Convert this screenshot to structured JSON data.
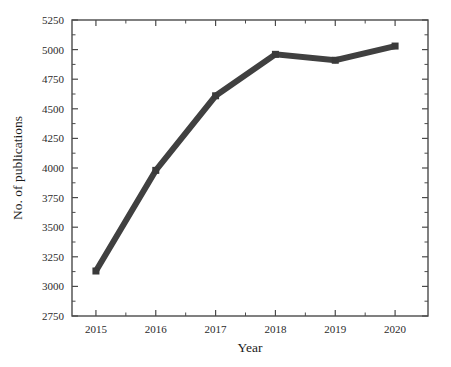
{
  "chart_data": {
    "type": "line",
    "title": "",
    "subtitle": "",
    "xlabel": "Year",
    "ylabel": "No. of publications",
    "categories": [
      "2015",
      "2016",
      "2017",
      "2018",
      "2019",
      "2020"
    ],
    "x": [
      2015,
      2016,
      2017,
      2018,
      2019,
      2020
    ],
    "values": [
      3130,
      3980,
      4610,
      4960,
      4910,
      5030
    ],
    "series": [
      {
        "name": "No. of publications",
        "values": [
          3130,
          3980,
          4610,
          4960,
          4910,
          5030
        ]
      }
    ],
    "ylim": [
      2750,
      5250
    ],
    "xlim": [
      2014.6,
      2020.55
    ],
    "ytick_labels": [
      "2750",
      "3000",
      "3250",
      "3500",
      "3750",
      "4000",
      "4250",
      "4500",
      "4750",
      "5000",
      "5250"
    ],
    "ytick_values": [
      2750,
      3000,
      3250,
      3500,
      3750,
      4000,
      4250,
      4500,
      4750,
      5000,
      5250
    ],
    "xtick_labels": [
      "2015",
      "2016",
      "2017",
      "2018",
      "2019",
      "2020"
    ],
    "xtick_values": [
      2015,
      2016,
      2017,
      2018,
      2019,
      2020
    ],
    "grid": false,
    "legend": false,
    "legend_position": "none",
    "line_color": "#404040",
    "marker_color": "#3a3a3a",
    "marker_shape": "square",
    "line_width": 6,
    "axis_color": "#4a4a4a",
    "background_color": "#ffffff",
    "annotations": []
  },
  "axes": {
    "x_title": "Year",
    "y_title": "No. of publications"
  }
}
